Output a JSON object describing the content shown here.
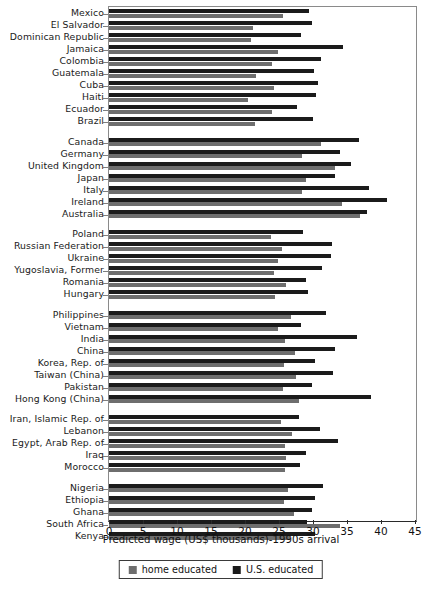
{
  "chart_data": {
    "type": "bar",
    "orientation": "horizontal",
    "title": "",
    "xlabel": "Predicted wage (US$ thousands)-1990s arrival",
    "ylabel": "",
    "xlim": [
      0,
      45
    ],
    "xticks": [
      0,
      5,
      10,
      15,
      20,
      25,
      30,
      35,
      40,
      45
    ],
    "xticklabels": [
      "0",
      "5",
      "10",
      "15",
      "20",
      "25",
      "30",
      "35",
      "40",
      "45"
    ],
    "grid": false,
    "legend_position": "bottom-center",
    "series": [
      {
        "name": "home educated",
        "color": "#6e6e6e"
      },
      {
        "name": "U.S. educated",
        "color": "#1b1b1b"
      }
    ],
    "groups": [
      {
        "name": "Latin America and Caribbean",
        "categories": [
          "Mexico",
          "El Salvador",
          "Dominican Republic",
          "Jamaica",
          "Colombia",
          "Guatemala",
          "Cuba",
          "Haiti",
          "Ecuador",
          "Brazil"
        ],
        "home_educated": [
          25.6,
          21.2,
          20.9,
          24.8,
          23.9,
          21.6,
          24.2,
          20.5,
          24.0,
          21.4
        ],
        "us_educated": [
          29.4,
          29.9,
          28.2,
          34.4,
          31.2,
          30.1,
          30.7,
          30.5,
          27.6,
          30.0
        ]
      },
      {
        "name": "Western Europe, Canada, Japan, Australia",
        "categories": [
          "Canada",
          "Germany",
          "United Kingdom",
          "Japan",
          "Italy",
          "Ireland",
          "Australia"
        ],
        "home_educated": [
          31.2,
          28.4,
          33.2,
          29.0,
          28.4,
          34.3,
          36.9
        ],
        "us_educated": [
          36.8,
          33.9,
          35.6,
          33.2,
          38.2,
          40.9,
          38.0
        ]
      },
      {
        "name": "Eastern Europe",
        "categories": [
          "Poland",
          "Russian Federation",
          "Ukraine",
          "Yugoslavia, Former",
          "Romania",
          "Hungary"
        ],
        "home_educated": [
          23.8,
          25.5,
          24.8,
          24.3,
          26.0,
          24.4
        ],
        "us_educated": [
          28.6,
          32.8,
          32.7,
          31.3,
          28.9,
          29.3
        ]
      },
      {
        "name": "Asia",
        "categories": [
          "Philippines",
          "Vietnam",
          "India",
          "China",
          "Korea, Rep. of",
          "Taiwan (China)",
          "Pakistan",
          "Hong Kong (China)"
        ],
        "home_educated": [
          26.7,
          24.9,
          25.9,
          27.4,
          25.7,
          27.5,
          25.6,
          27.9
        ],
        "us_educated": [
          31.9,
          28.2,
          36.4,
          33.2,
          30.3,
          33.0,
          29.8,
          38.5
        ]
      },
      {
        "name": "Middle East and North Africa",
        "categories": [
          "Iran, Islamic Rep. of",
          "Lebanon",
          "Egypt, Arab Rep. of",
          "Iraq",
          "Morocco"
        ],
        "home_educated": [
          25.3,
          26.9,
          25.9,
          26.1,
          25.9
        ],
        "us_educated": [
          28.0,
          31.0,
          33.7,
          28.9,
          28.1
        ]
      },
      {
        "name": "Sub-Saharan Africa",
        "categories": [
          "Nigeria",
          "Ethiopia",
          "Ghana",
          "South Africa",
          "Kenya"
        ],
        "home_educated": [
          26.3,
          25.8,
          27.2,
          34.0,
          26.6
        ],
        "us_educated": [
          31.4,
          30.3,
          29.8,
          29.1,
          30.3
        ]
      }
    ]
  },
  "legend": {
    "items": [
      {
        "label": "home educated"
      },
      {
        "label": "U.S. educated"
      }
    ]
  },
  "axis": {
    "title": "Predicted wage (US$ thousands)-1990s arrival"
  }
}
